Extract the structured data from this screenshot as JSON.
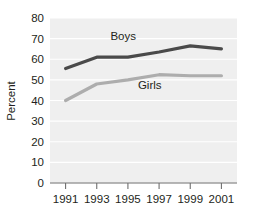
{
  "chart_data": {
    "type": "line",
    "title": "",
    "xlabel": "",
    "ylabel": "Percent",
    "categories": [
      "1991",
      "1993",
      "1995",
      "1997",
      "1999",
      "2001"
    ],
    "x": [
      1991,
      1993,
      1995,
      1997,
      1999,
      2001
    ],
    "xlim": [
      1990,
      2002
    ],
    "ylim": [
      0,
      80
    ],
    "yticks": [
      0,
      10,
      20,
      30,
      40,
      50,
      60,
      70,
      80
    ],
    "ytick_labels": [
      "0",
      "10",
      "20",
      "30",
      "40",
      "50",
      "60",
      "70",
      "80"
    ],
    "grid": true,
    "legend_position": "inline-annotations",
    "series": [
      {
        "name": "Boys",
        "color": "#4a4a4a",
        "values": [
          55.5,
          61,
          61,
          63.5,
          66.5,
          65
        ],
        "label_x": 1994.7,
        "label_y": 69.5
      },
      {
        "name": "Girls",
        "color": "#adadad",
        "values": [
          40,
          48,
          50,
          52.5,
          52,
          52
        ],
        "label_x": 1996.4,
        "label_y": 45.5
      }
    ],
    "annotations": [
      {
        "text": "Boys",
        "series": "Boys"
      },
      {
        "text": "Girls",
        "series": "Girls"
      }
    ],
    "colors": {
      "plot_background": "#efefef",
      "gridline": "#ffffff",
      "axis": "#6f6f6f",
      "text": "#231f20",
      "page_background": "#ffffff"
    }
  }
}
